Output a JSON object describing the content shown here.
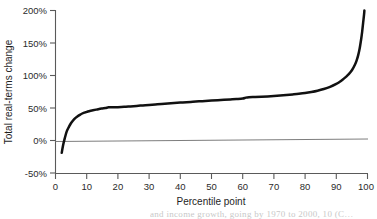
{
  "chart_data": {
    "type": "line",
    "title": "",
    "xlabel": "Percentile point",
    "ylabel": "Total real-terms change",
    "xlim": [
      0,
      100
    ],
    "ylim": [
      -50,
      200
    ],
    "grid": false,
    "legend": null,
    "x_ticks": [
      "0",
      "10",
      "20",
      "30",
      "40",
      "50",
      "60",
      "70",
      "80",
      "90",
      "100"
    ],
    "x_tick_values": [
      0,
      10,
      20,
      30,
      40,
      50,
      60,
      70,
      80,
      90,
      100
    ],
    "y_ticks": [
      "-50%",
      "0%",
      "50%",
      "100%",
      "150%",
      "200%"
    ],
    "y_tick_values": [
      -50,
      0,
      50,
      100,
      150,
      200
    ],
    "reference_lines": [
      {
        "name": "zero-line",
        "y": 0,
        "color": "#6e6e6e"
      }
    ],
    "series": [
      {
        "name": "Total real-terms change by percentile",
        "color": "#111111",
        "x": [
          2,
          2.4,
          3,
          3.6,
          4.3,
          5,
          6,
          7,
          8,
          9,
          10,
          11,
          12,
          13,
          14,
          15,
          16,
          17,
          18,
          19,
          20,
          22,
          24,
          26,
          28,
          30,
          32,
          34,
          36,
          38,
          40,
          42,
          44,
          46,
          48,
          50,
          52,
          54,
          56,
          58,
          60,
          61,
          62,
          64,
          66,
          68,
          70,
          72,
          74,
          76,
          78,
          80,
          82,
          84,
          86,
          88,
          90,
          91,
          92,
          93,
          94,
          95,
          96,
          96.5,
          97,
          97.5,
          98,
          98.3,
          98.6,
          98.9,
          99
        ],
        "y": [
          -19,
          -8,
          4,
          14,
          21,
          27,
          33,
          37,
          40,
          42.5,
          44,
          45.5,
          46.5,
          47.5,
          48.5,
          49.3,
          50,
          51,
          51.2,
          51.2,
          51.3,
          51.8,
          52.5,
          53.2,
          54,
          54.8,
          55.5,
          56.2,
          57,
          57.7,
          58.3,
          59,
          59.6,
          60.2,
          60.8,
          61.4,
          62,
          62.6,
          63.2,
          63.8,
          64.6,
          66,
          66.6,
          66.9,
          67.3,
          67.8,
          68.4,
          69.1,
          69.9,
          70.8,
          71.8,
          73,
          74.6,
          76.6,
          79.2,
          82.5,
          87,
          90,
          93.5,
          97.5,
          102,
          108,
          117,
          123,
          131,
          142,
          157,
          168,
          181,
          194,
          200
        ]
      }
    ]
  },
  "caption": {
    "fragment": "and income growth, going by 1970 to 2000, 10 (C…"
  },
  "icons": {
    "none": ""
  }
}
